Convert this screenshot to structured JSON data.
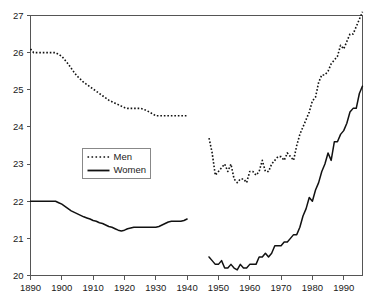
{
  "chart_data": {
    "type": "line",
    "title": "",
    "subtitle": "",
    "xlabel": "",
    "ylabel": "",
    "xlim": [
      1890,
      1996
    ],
    "ylim": [
      20,
      27
    ],
    "grid": false,
    "legend_position": "center-left",
    "x_ticks": [
      1890,
      1900,
      1910,
      1920,
      1930,
      1940,
      1950,
      1960,
      1970,
      1980,
      1990
    ],
    "x_tick_labels": [
      "1890",
      "1900",
      "1910",
      "1920",
      "1930",
      "1940",
      "1950",
      "1960",
      "1970",
      "1980",
      "1990"
    ],
    "y_ticks": [
      20,
      21,
      22,
      23,
      24,
      25,
      26,
      27
    ],
    "y_tick_labels": [
      "20",
      "21",
      "22",
      "23",
      "24",
      "25",
      "26",
      "27"
    ],
    "note": "Two series, each drawn as two segments with a data gap between 1940 and 1947.",
    "series": [
      {
        "name": "Men",
        "style": "dashed",
        "color": "#111111",
        "segments": [
          {
            "x": [
              1890,
              1891,
              1892,
              1893,
              1894,
              1895,
              1896,
              1897,
              1898,
              1899,
              1900,
              1901,
              1902,
              1903,
              1904,
              1905,
              1906,
              1907,
              1908,
              1909,
              1910,
              1911,
              1912,
              1913,
              1914,
              1915,
              1916,
              1917,
              1918,
              1919,
              1920,
              1921,
              1922,
              1923,
              1924,
              1925,
              1926,
              1927,
              1928,
              1929,
              1930,
              1931,
              1932,
              1933,
              1934,
              1935,
              1936,
              1937,
              1938,
              1939,
              1940
            ],
            "y": [
              26.1,
              26.0,
              26.0,
              26.0,
              26.0,
              26.0,
              26.0,
              26.0,
              26.0,
              25.95,
              25.9,
              25.8,
              25.7,
              25.58,
              25.46,
              25.36,
              25.28,
              25.2,
              25.14,
              25.08,
              25.02,
              24.96,
              24.9,
              24.84,
              24.78,
              24.72,
              24.68,
              24.64,
              24.6,
              24.56,
              24.52,
              24.5,
              24.5,
              24.5,
              24.5,
              24.5,
              24.48,
              24.44,
              24.4,
              24.35,
              24.3,
              24.3,
              24.3,
              24.3,
              24.3,
              24.3,
              24.3,
              24.3,
              24.3,
              24.3,
              24.3
            ]
          },
          {
            "x": [
              1947,
              1948,
              1949,
              1950,
              1951,
              1952,
              1953,
              1954,
              1955,
              1956,
              1957,
              1958,
              1959,
              1960,
              1961,
              1962,
              1963,
              1964,
              1965,
              1966,
              1967,
              1968,
              1969,
              1970,
              1971,
              1972,
              1973,
              1974,
              1975,
              1976,
              1977,
              1978,
              1979,
              1980,
              1981,
              1982,
              1983,
              1984,
              1985,
              1986,
              1987,
              1988,
              1989,
              1990,
              1991,
              1992,
              1993,
              1994,
              1995,
              1996
            ],
            "y": [
              23.7,
              23.3,
              22.7,
              22.8,
              22.9,
              23.0,
              22.8,
              23.0,
              22.6,
              22.5,
              22.6,
              22.6,
              22.5,
              22.8,
              22.8,
              22.7,
              22.8,
              23.1,
              22.8,
              22.8,
              23.0,
              23.1,
              23.2,
              23.2,
              23.1,
              23.3,
              23.2,
              23.1,
              23.5,
              23.8,
              24.0,
              24.2,
              24.4,
              24.7,
              24.8,
              25.2,
              25.4,
              25.4,
              25.5,
              25.7,
              25.8,
              25.9,
              26.2,
              26.1,
              26.3,
              26.5,
              26.5,
              26.7,
              26.9,
              27.1
            ]
          }
        ]
      },
      {
        "name": "Women",
        "style": "solid",
        "color": "#111111",
        "segments": [
          {
            "x": [
              1890,
              1891,
              1892,
              1893,
              1894,
              1895,
              1896,
              1897,
              1898,
              1899,
              1900,
              1901,
              1902,
              1903,
              1904,
              1905,
              1906,
              1907,
              1908,
              1909,
              1910,
              1911,
              1912,
              1913,
              1914,
              1915,
              1916,
              1917,
              1918,
              1919,
              1920,
              1921,
              1922,
              1923,
              1924,
              1925,
              1926,
              1927,
              1928,
              1929,
              1930,
              1931,
              1932,
              1933,
              1934,
              1935,
              1936,
              1937,
              1938,
              1939,
              1940
            ],
            "y": [
              22.0,
              22.0,
              22.0,
              22.0,
              22.0,
              22.0,
              22.0,
              22.0,
              22.0,
              21.96,
              21.92,
              21.86,
              21.8,
              21.74,
              21.7,
              21.66,
              21.62,
              21.58,
              21.55,
              21.52,
              21.48,
              21.46,
              21.42,
              21.4,
              21.36,
              21.32,
              21.3,
              21.26,
              21.22,
              21.2,
              21.22,
              21.26,
              21.28,
              21.3,
              21.3,
              21.3,
              21.3,
              21.3,
              21.3,
              21.3,
              21.3,
              21.32,
              21.36,
              21.4,
              21.44,
              21.46,
              21.46,
              21.46,
              21.46,
              21.48,
              21.52
            ]
          },
          {
            "x": [
              1947,
              1948,
              1949,
              1950,
              1951,
              1952,
              1953,
              1954,
              1955,
              1956,
              1957,
              1958,
              1959,
              1960,
              1961,
              1962,
              1963,
              1964,
              1965,
              1966,
              1967,
              1968,
              1969,
              1970,
              1971,
              1972,
              1973,
              1974,
              1975,
              1976,
              1977,
              1978,
              1979,
              1980,
              1981,
              1982,
              1983,
              1984,
              1985,
              1986,
              1987,
              1988,
              1989,
              1990,
              1991,
              1992,
              1993,
              1994,
              1995,
              1996
            ],
            "y": [
              20.5,
              20.4,
              20.3,
              20.3,
              20.4,
              20.2,
              20.2,
              20.3,
              20.2,
              20.15,
              20.3,
              20.2,
              20.2,
              20.3,
              20.3,
              20.3,
              20.5,
              20.5,
              20.6,
              20.5,
              20.6,
              20.8,
              20.8,
              20.8,
              20.9,
              20.9,
              21.0,
              21.1,
              21.1,
              21.3,
              21.6,
              21.8,
              22.1,
              22.0,
              22.3,
              22.5,
              22.8,
              23.0,
              23.3,
              23.1,
              23.6,
              23.6,
              23.8,
              23.9,
              24.1,
              24.4,
              24.5,
              24.5,
              24.9,
              25.1
            ]
          }
        ]
      }
    ],
    "legend": [
      {
        "label": "Men",
        "style": "dashed"
      },
      {
        "label": "Women",
        "style": "solid"
      }
    ]
  }
}
